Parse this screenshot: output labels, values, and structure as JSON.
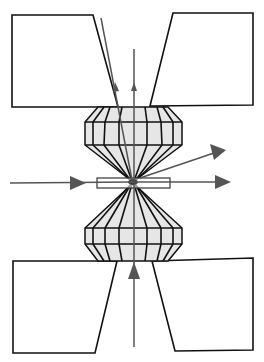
{
  "diagram": {
    "colors": {
      "outline": "#111111",
      "diamond_fill": "#e6e6e6",
      "beam": "#555555",
      "background": "#ffffff"
    },
    "components": [
      {
        "id": "upper-seat-left",
        "label": "Upper seat (left)"
      },
      {
        "id": "upper-seat-right",
        "label": "Upper seat (right)"
      },
      {
        "id": "upper-diamond",
        "label": "Upper diamond anvil"
      },
      {
        "id": "gasket",
        "label": "Gasket"
      },
      {
        "id": "sample",
        "label": "Sample"
      },
      {
        "id": "lower-diamond",
        "label": "Lower diamond anvil"
      },
      {
        "id": "lower-seat-left",
        "label": "Lower seat (left)"
      },
      {
        "id": "lower-seat-right",
        "label": "Lower seat (right)"
      }
    ],
    "beams": [
      {
        "id": "incident-horizontal",
        "direction": "left-to-right, through gasket"
      },
      {
        "id": "transmitted-horizontal",
        "direction": "exits right"
      },
      {
        "id": "diffracted-oblique",
        "direction": "up-right"
      },
      {
        "id": "axial-from-below",
        "direction": "upward along axis"
      },
      {
        "id": "axial-up-top",
        "direction": "upward through upper opening"
      },
      {
        "id": "oblique-top",
        "direction": "upward along left seat edge"
      }
    ],
    "text_labels": []
  }
}
